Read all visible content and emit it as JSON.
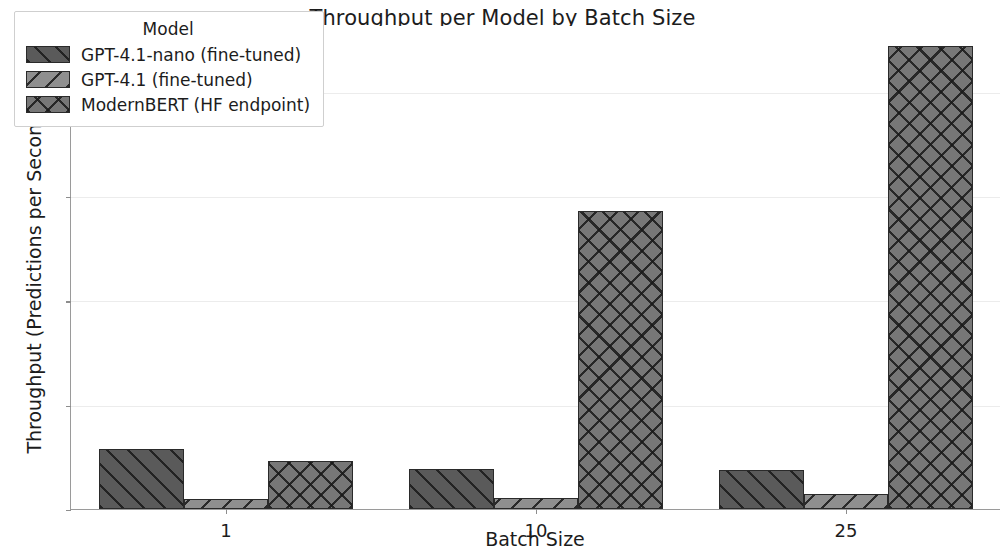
{
  "chart_data": {
    "type": "bar",
    "title": "Throughput per Model by Batch Size",
    "xlabel": "Batch Size",
    "ylabel": "Throughput (Predictions per Second)",
    "categories": [
      "1",
      "10",
      "25"
    ],
    "series": [
      {
        "name": "GPT-4.1-nano (fine-tuned)",
        "values": [
          2.9,
          1.9,
          1.85
        ],
        "color": "#5a5a5a",
        "hatch": "forward-diagonal"
      },
      {
        "name": "GPT-4.1 (fine-tuned)",
        "values": [
          0.5,
          0.55,
          0.7
        ],
        "color": "#8f8f8f",
        "hatch": "back-diagonal"
      },
      {
        "name": "ModernBERT (HF endpoint)",
        "values": [
          2.3,
          14.3,
          22.2
        ],
        "color": "#777777",
        "hatch": "crosshatch"
      }
    ],
    "ylim": [
      0,
      23.2
    ],
    "yticks": [
      0,
      5,
      10,
      15,
      20
    ],
    "ytick_labels": [
      "0",
      "5",
      "10",
      "15",
      "20"
    ],
    "grid": true,
    "legend": {
      "title": "Model",
      "position": "upper left"
    }
  }
}
